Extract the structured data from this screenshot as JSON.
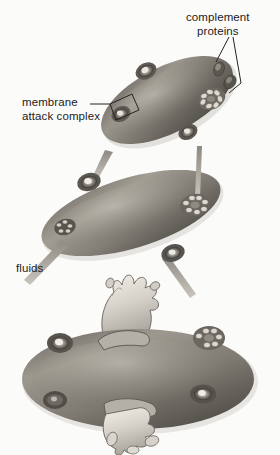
{
  "figure": {
    "background_color": "#fbfbfa",
    "ink_color": "#1c1c1c",
    "cell_color_dark": "#4a4742",
    "cell_color_mid": "#8a867e",
    "cell_color_light": "#b9b5ac",
    "cytoplasm_color": "#dedbd3",
    "arrow_color": "#a6a29a"
  },
  "labels": {
    "complement_proteins": "complement\nproteins",
    "membrane_attack_complex": "membrane\nattack complex",
    "fluids": "fluids"
  },
  "stages": [
    {
      "name": "stage-1-attachment",
      "caption": "complement proteins bind and assemble pores",
      "pore_count": 3,
      "free_protein_count": 2
    },
    {
      "name": "stage-2-fluid-influx",
      "caption": "fluids enter through membrane attack complexes",
      "pore_count": 4,
      "arrow_count": 4
    },
    {
      "name": "stage-3-lysis",
      "caption": "cell swells and bursts",
      "pore_count": 4,
      "eruption_count": 2
    }
  ]
}
